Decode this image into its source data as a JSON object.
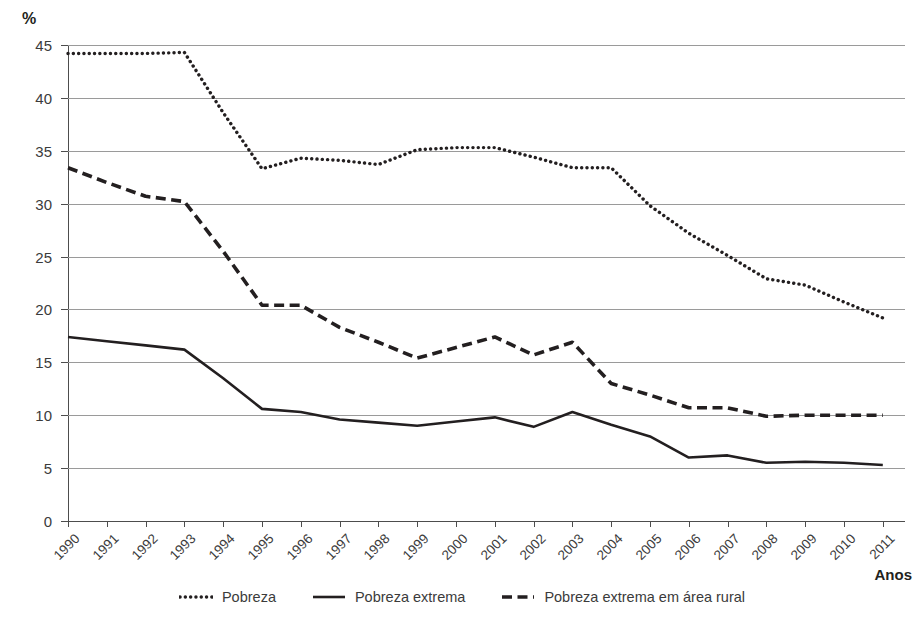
{
  "axes": {
    "y_unit_label": "%",
    "x_axis_title": "Anos",
    "y_ticks": [
      "0",
      "5",
      "10",
      "15",
      "20",
      "25",
      "30",
      "35",
      "40",
      "45"
    ]
  },
  "legend": {
    "items": [
      {
        "label": "Pobreza",
        "style": "dotted",
        "color": "#231f20"
      },
      {
        "label": "Pobreza extrema",
        "style": "solid",
        "color": "#231f20"
      },
      {
        "label": "Pobreza extrema em área rural",
        "style": "dashed",
        "color": "#231f20"
      }
    ]
  },
  "chart_data": {
    "type": "line",
    "title": "",
    "subtitle": "",
    "xlabel": "Anos",
    "ylabel": "%",
    "ylim": [
      0,
      45
    ],
    "ytick_step": 5,
    "grid": true,
    "legend_position": "bottom",
    "categories": [
      "1990",
      "1991",
      "1992",
      "1993",
      "1994",
      "1995",
      "1996",
      "1997",
      "1998",
      "1999",
      "2000",
      "2001",
      "2002",
      "2003",
      "2004",
      "2005",
      "2006",
      "2007",
      "2008",
      "2009",
      "2010",
      "2011"
    ],
    "series": [
      {
        "name": "Pobreza",
        "style": "dotted",
        "values": [
          44.2,
          44.2,
          44.2,
          44.3,
          38.6,
          33.3,
          34.3,
          34.1,
          33.7,
          35.1,
          35.3,
          35.3,
          34.4,
          33.4,
          33.4,
          29.8,
          27.2,
          25.1,
          22.9,
          22.3,
          20.7,
          19.2
        ]
      },
      {
        "name": "Pobreza extrema",
        "style": "solid",
        "values": [
          17.4,
          17.0,
          16.6,
          16.2,
          13.5,
          10.6,
          10.3,
          9.6,
          9.3,
          9.0,
          9.4,
          9.8,
          8.9,
          10.3,
          9.1,
          8.0,
          6.0,
          6.2,
          5.5,
          5.6,
          5.5,
          5.3
        ]
      },
      {
        "name": "Pobreza extrema em área rural",
        "style": "dashed",
        "values": [
          33.4,
          32.0,
          30.7,
          30.2,
          25.5,
          20.4,
          20.4,
          18.3,
          16.9,
          15.4,
          16.4,
          17.4,
          15.7,
          16.9,
          13.0,
          11.9,
          10.7,
          10.7,
          9.9,
          10.0,
          10.0,
          10.0
        ]
      }
    ]
  }
}
